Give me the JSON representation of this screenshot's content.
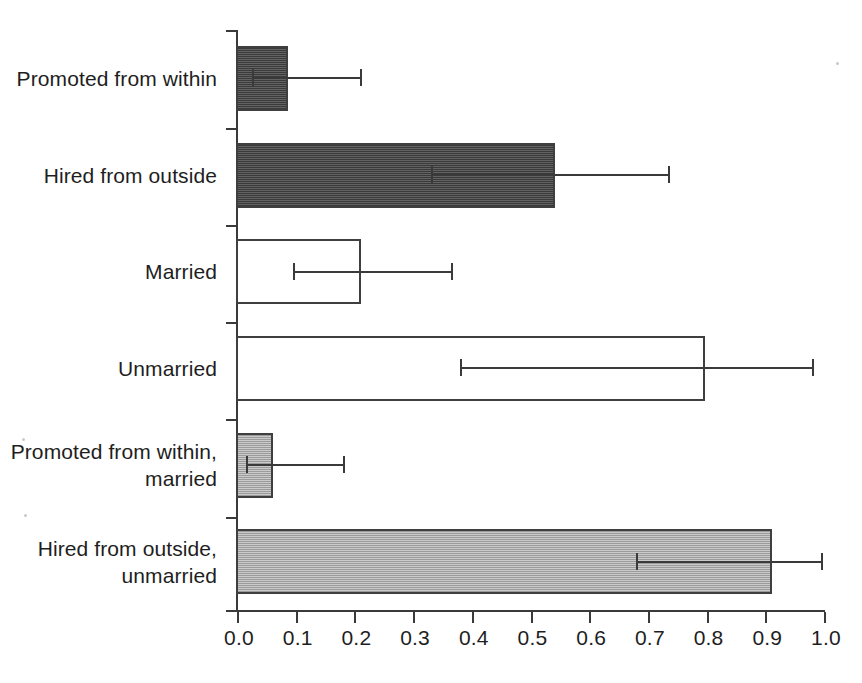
{
  "chart_data": {
    "type": "bar",
    "orientation": "horizontal",
    "title": "",
    "xlabel": "",
    "ylabel": "",
    "xlim": [
      0.0,
      1.0
    ],
    "grid": false,
    "legend": "none",
    "categories": [
      "Promoted from within",
      "Hired from outside",
      "Married",
      "Unmarried",
      "Promoted from within, married",
      "Hired from outside, unmarried"
    ],
    "category_labels_wrapped": [
      [
        "Promoted from within"
      ],
      [
        "Hired from outside"
      ],
      [
        "Married"
      ],
      [
        "Unmarried"
      ],
      [
        "Promoted from within,",
        "married"
      ],
      [
        "Hired from outside,",
        "unmarried"
      ]
    ],
    "values": [
      0.085,
      0.54,
      0.21,
      0.795,
      0.06,
      0.91
    ],
    "error_low": [
      0.025,
      0.33,
      0.095,
      0.38,
      0.015,
      0.68
    ],
    "error_high": [
      0.21,
      0.735,
      0.365,
      0.98,
      0.18,
      0.995
    ],
    "bar_styles": [
      "dark",
      "dark",
      "none",
      "none",
      "light",
      "light"
    ],
    "xticks": [
      0.0,
      0.1,
      0.2,
      0.3,
      0.4,
      0.5,
      0.6,
      0.7,
      0.8,
      0.9,
      1.0
    ],
    "xtick_labels": [
      "0.0",
      "0.1",
      "0.2",
      "0.3",
      "0.4",
      "0.5",
      "0.6",
      "0.7",
      "0.8",
      "0.9",
      "1.0"
    ],
    "series": [
      {
        "name": "Probability",
        "points": [
          {
            "category": "Promoted from within",
            "value": 0.085,
            "ci_low": 0.025,
            "ci_high": 0.21,
            "style": "dark"
          },
          {
            "category": "Hired from outside",
            "value": 0.54,
            "ci_low": 0.33,
            "ci_high": 0.735,
            "style": "dark"
          },
          {
            "category": "Married",
            "value": 0.21,
            "ci_low": 0.095,
            "ci_high": 0.365,
            "style": "none"
          },
          {
            "category": "Unmarried",
            "value": 0.795,
            "ci_low": 0.38,
            "ci_high": 0.98,
            "style": "none"
          },
          {
            "category": "Promoted from within, married",
            "value": 0.06,
            "ci_low": 0.015,
            "ci_high": 0.18,
            "style": "light"
          },
          {
            "category": "Hired from outside, unmarried",
            "value": 0.91,
            "ci_low": 0.68,
            "ci_high": 0.995,
            "style": "light"
          }
        ]
      }
    ],
    "colors": {
      "dark_fill": "#4d4d4d",
      "light_fill": "#b4b4b4",
      "no_fill": "#ffffff",
      "outline": "#3f3f3f",
      "axis": "#3a3a3a",
      "text": "#1e1e1e",
      "background": "#ffffff"
    }
  }
}
